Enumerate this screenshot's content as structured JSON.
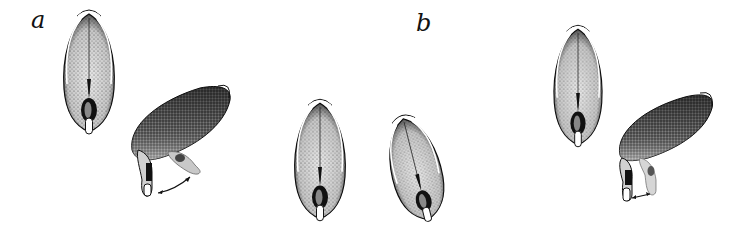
{
  "figure": {
    "panels": [
      {
        "label": "a",
        "description": "Duck shown from above: head held forward, then head dipped down with arrow indicating head movement"
      },
      {
        "label": "b",
        "description": "Duck shown from above in upright postures, then head-down posture with arrow indicating movement"
      }
    ],
    "colors": {
      "ink": "#111111",
      "stipple_light": "#d9d9d9",
      "stipple_mid": "#9a9a9a",
      "background": "#ffffff"
    }
  }
}
